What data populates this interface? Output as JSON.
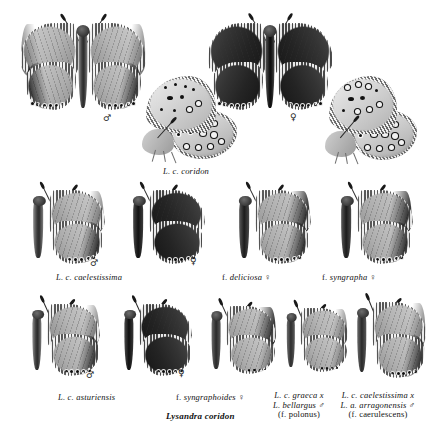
{
  "plate": {
    "title": "Lysandra coridon",
    "background": "#ffffff",
    "symbols": {
      "male": "♂",
      "female": "♀"
    }
  },
  "rows": [
    {
      "id": "row-1",
      "specimens": [
        {
          "name": "coridon-male-dorsal",
          "view": "dorsal",
          "sex": "♂",
          "shade": "pale"
        },
        {
          "name": "coridon-male-ventral",
          "view": "lateral",
          "sex": "",
          "shade": "pale"
        },
        {
          "name": "coridon-female-dorsal",
          "view": "dorsal",
          "sex": "♀",
          "shade": "dark"
        },
        {
          "name": "coridon-female-ventral",
          "view": "lateral",
          "sex": "",
          "shade": "pale"
        }
      ],
      "caption": "L. c. coridon"
    },
    {
      "id": "row-2",
      "specimens": [
        {
          "name": "caelestissima-male",
          "view": "lateral-open",
          "sex": "♂",
          "shade": "pale"
        },
        {
          "name": "caelestissima-female",
          "view": "lateral-open",
          "sex": "♀",
          "shade": "dark"
        },
        {
          "name": "deliciosa-female",
          "view": "lateral-open",
          "sex": "♀",
          "shade": "pale"
        },
        {
          "name": "syngrapha-female",
          "view": "lateral-open",
          "sex": "♀",
          "shade": "pale"
        }
      ],
      "captions": [
        "L. c. caelestissima",
        "f. deliciosa ♀",
        "f. syngrapha ♀"
      ]
    },
    {
      "id": "row-3",
      "specimens": [
        {
          "name": "asturiensis-male",
          "view": "lateral-open",
          "sex": "♂",
          "shade": "pale"
        },
        {
          "name": "asturiensis-female",
          "view": "lateral-open",
          "sex": "♀",
          "shade": "dark"
        },
        {
          "name": "syngraphoides-female",
          "view": "lateral-open",
          "sex": "",
          "shade": "pale"
        },
        {
          "name": "polonus-hybrid",
          "view": "lateral-open",
          "sex": "",
          "shade": "pale"
        },
        {
          "name": "caerulescens-hybrid",
          "view": "lateral-open",
          "sex": "",
          "shade": "pale"
        }
      ]
    }
  ],
  "captions": {
    "row1_main": "L. c. coridon",
    "row2_a": "L. c. caelestissima",
    "row2_b": "f. deliciosa ♀",
    "row2_c": "f. syngrapha ♀",
    "row3_a": "L. c. asturiensis",
    "row3_b": "f. syngraphoides ♀",
    "row3_c_line1": "L. c. graeca x",
    "row3_c_line2": "L. bellargus ♂",
    "row3_c_line3": "(f. polonus)",
    "row3_d_line1": "L. c. caelestissima x",
    "row3_d_line2": "L. a. arragonensis ♂",
    "row3_d_line3": "(f. caerulescens)",
    "plate_title": "Lysandra coridon"
  },
  "symbols": {
    "row1_male": "♂",
    "row1_female": "♀",
    "row2_male": "♂",
    "row2_female": "♀",
    "row3_male": "♂",
    "row3_female": "♀"
  }
}
